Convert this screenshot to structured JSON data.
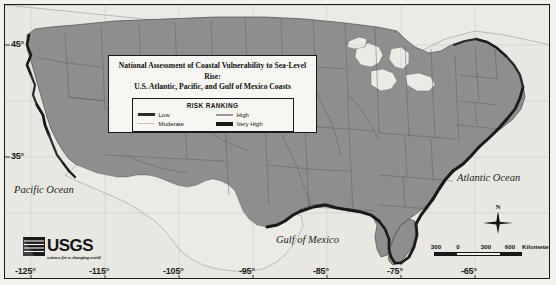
{
  "figure": {
    "name": "usgs-coastal-vulnerability-map",
    "background_color": "#eceae5",
    "land_fill": "#8e8e8e",
    "outside_fill": "#e9e7e2",
    "border_color": "#1a1a1a"
  },
  "title": {
    "line1": "National Assessment of Coastal Vulnerability to Sea-Level Rise:",
    "line2": "U.S. Atlantic, Pacific, and Gulf of Mexico Coasts"
  },
  "legend": {
    "heading": "RISK RANKING",
    "entries": [
      {
        "label": "Low",
        "color": "#2b2b2b",
        "thickness": 3
      },
      {
        "label": "High",
        "color": "#9a9a9a",
        "thickness": 2
      },
      {
        "label": "Moderate",
        "color": "#c2c2c2",
        "thickness": 1.5
      },
      {
        "label": "Very High",
        "color": "#1a1a1a",
        "thickness": 4
      }
    ]
  },
  "graticule": {
    "lat_labels": [
      "45°",
      "35°"
    ],
    "lon_labels": [
      "-125°",
      "-115°",
      "-105°",
      "-95°",
      "-85°",
      "-75°",
      "-65°"
    ]
  },
  "ocean_labels": [
    {
      "name": "Pacific Ocean"
    },
    {
      "name": "Atlantic Ocean"
    },
    {
      "name": "Gulf of Mexico"
    }
  ],
  "usgs": {
    "wordmark": "USGS",
    "tagline": "science for a changing world"
  },
  "north_arrow": {
    "label": "N"
  },
  "scale_bar": {
    "ticks": [
      "300",
      "0",
      "300",
      "600"
    ],
    "unit": "Kilometers"
  }
}
